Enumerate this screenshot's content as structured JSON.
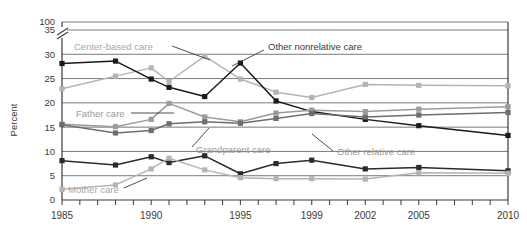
{
  "chart_data": {
    "type": "line",
    "title": "",
    "xlabel": "",
    "ylabel": "Percent",
    "ylim": [
      0,
      35
    ],
    "y_break": {
      "above_label": "100",
      "below_label": "35"
    },
    "yticks": [
      "0",
      "5",
      "10",
      "15",
      "20",
      "25",
      "30",
      "35",
      "100"
    ],
    "grid": true,
    "legend": "inline-annotations",
    "x": [
      1985,
      1988,
      1990,
      1991,
      1993,
      1995,
      1997,
      1999,
      2002,
      2005,
      2010
    ],
    "xtick_years": [
      1985,
      1986,
      1987,
      1988,
      1989,
      1990,
      1991,
      1992,
      1993,
      1994,
      1995,
      1996,
      1997,
      1998,
      1999,
      2000,
      2001,
      2002,
      2003,
      2004,
      2005,
      2006,
      2007,
      2008,
      2009,
      2010
    ],
    "xtick_labels": [
      "1985",
      "1990",
      "1995",
      "1999",
      "2002",
      "2005",
      "2010"
    ],
    "xtick_label_years": [
      1985,
      1990,
      1995,
      1999,
      2002,
      2005,
      2010
    ],
    "series": [
      {
        "name": "Center-based care",
        "color": "#b4b4b4",
        "label_color_class": "lbl-light",
        "values": [
          22.9,
          25.5,
          27.2,
          24.4,
          29.6,
          24.9,
          22.2,
          21.1,
          23.8,
          23.6,
          23.5
        ]
      },
      {
        "name": "Other nonrelative care",
        "color": "#1a1a1a",
        "label_color_class": "lbl-dark",
        "values": [
          28.1,
          28.6,
          24.9,
          23.2,
          21.3,
          28.2,
          20.4,
          18.2,
          16.6,
          15.3,
          13.3
        ]
      },
      {
        "name": "Father care",
        "color": "#9b9b9b",
        "label_color_class": "lbl-mid",
        "values": [
          15.6,
          15.1,
          16.6,
          19.9,
          17.1,
          16.1,
          17.9,
          18.5,
          18.2,
          18.7,
          19.2
        ]
      },
      {
        "name": "Grandparent care",
        "color": "#6e6e6e",
        "label_color_class": "lbl-mid",
        "values": [
          15.5,
          13.8,
          14.3,
          15.7,
          16.1,
          15.8,
          16.8,
          17.8,
          17.1,
          17.5,
          18.0
        ]
      },
      {
        "name": "Other relative care",
        "color": "#2b2b2b",
        "label_color_class": "lbl-mid",
        "values": [
          8.1,
          7.2,
          8.9,
          7.7,
          9.1,
          5.4,
          7.5,
          8.2,
          6.4,
          6.7,
          6.0
        ]
      },
      {
        "name": "Mother care",
        "color": "#b4b4b4",
        "label_color_class": "lbl-light",
        "values": [
          2.2,
          3.1,
          6.4,
          8.6,
          6.2,
          4.6,
          4.4,
          4.4,
          4.3,
          5.6,
          5.5
        ]
      }
    ],
    "annotations": [
      {
        "text": "Center-based care",
        "target": "Center-based care"
      },
      {
        "text": "Other nonrelative care",
        "target": "Other nonrelative care"
      },
      {
        "text": "Father care",
        "target": "Father care"
      },
      {
        "text": "Grandparent care",
        "target": "Grandparent care"
      },
      {
        "text": "Other relative care",
        "target": "Other relative care"
      },
      {
        "text": "Mother care",
        "target": "Mother care"
      }
    ]
  }
}
